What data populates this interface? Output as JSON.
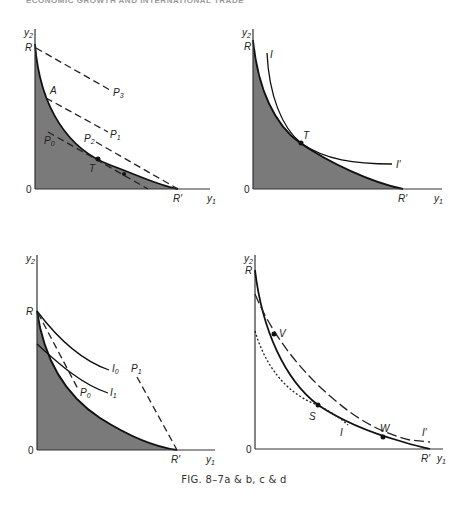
{
  "header": {
    "text": "ECONOMIC GROWTH AND INTERNATIONAL TRADE"
  },
  "caption": "FIG. 8–7a & b, c & d",
  "panels": {
    "a": {
      "y_axis_label": "y",
      "y_axis_sub": "2",
      "x_axis_label": "y",
      "x_axis_sub": "1",
      "origin": "0",
      "labels": {
        "R": "R",
        "R_prime": "R′",
        "A": "A",
        "T": "T",
        "P0": "P",
        "P0_sub": "0",
        "P1": "P",
        "P1_sub": "1",
        "P2": "P",
        "P2_sub": "2",
        "P3": "P",
        "P3_sub": "3"
      }
    },
    "b": {
      "y_axis_label": "y",
      "y_axis_sub": "2",
      "x_axis_label": "y",
      "x_axis_sub": "1",
      "origin": "0",
      "labels": {
        "R": "R",
        "R_prime": "R′",
        "T": "T",
        "I": "I",
        "I_prime": "I′"
      }
    },
    "c": {
      "y_axis_label": "y",
      "y_axis_sub": "2",
      "x_axis_label": "y",
      "x_axis_sub": "1",
      "origin": "0",
      "labels": {
        "R": "R",
        "R_prime": "R′",
        "I0": "I",
        "I0_sub": "0",
        "I1": "I",
        "I1_sub": "1",
        "P0": "P",
        "P0_sub": "0",
        "P1": "P",
        "P1_sub": "1"
      }
    },
    "d": {
      "y_axis_label": "y",
      "y_axis_sub": "2",
      "x_axis_label": "y",
      "x_axis_sub": "1",
      "origin": "0",
      "labels": {
        "R": "R",
        "R_prime": "R′",
        "V": "V",
        "S": "S",
        "W": "W",
        "I": "I",
        "I_prime": "I′"
      }
    }
  },
  "colors": {
    "shade": "#7a7a7a",
    "line": "#111111"
  }
}
